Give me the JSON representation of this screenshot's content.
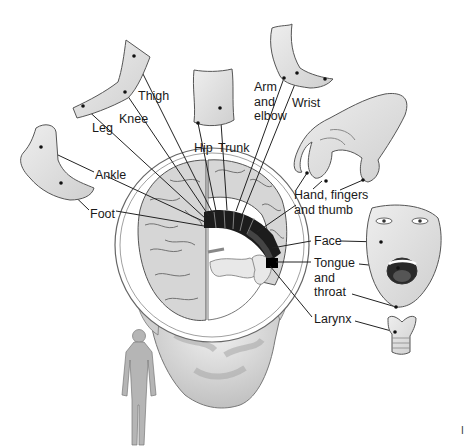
{
  "diagram": {
    "type": "somatotopic-map",
    "colors": {
      "skin_fill": "#e4e4e4",
      "skin_stroke": "#555555",
      "brain_fill": "#d9d9d9",
      "cortex_strip": "#1c1c1c",
      "leader_line": "#222222",
      "text": "#1a1a1a"
    },
    "labels": [
      {
        "id": "thigh",
        "text": "Thigh",
        "x": 138,
        "y": 96
      },
      {
        "id": "knee",
        "text": "Knee",
        "x": 119,
        "y": 111
      },
      {
        "id": "leg",
        "text": "Leg",
        "x": 92,
        "y": 122
      },
      {
        "id": "hip",
        "text": "Hip",
        "x": 194,
        "y": 141
      },
      {
        "id": "trunk",
        "text": "Trunk",
        "x": 218,
        "y": 141
      },
      {
        "id": "arm-elbow",
        "text": "Arm\nand\nelbow",
        "x": 254,
        "y": 82
      },
      {
        "id": "wrist",
        "text": "Wrist",
        "x": 292,
        "y": 96
      },
      {
        "id": "ankle",
        "text": "Ankle",
        "x": 95,
        "y": 169
      },
      {
        "id": "foot",
        "text": "Foot",
        "x": 90,
        "y": 207
      },
      {
        "id": "hand",
        "text": "Hand, fingers\nand thumb",
        "x": 294,
        "y": 190
      },
      {
        "id": "face",
        "text": "Face",
        "x": 314,
        "y": 234
      },
      {
        "id": "tongue",
        "text": "Tongue\nand\nthroat",
        "x": 314,
        "y": 256
      },
      {
        "id": "larynx",
        "text": "Larynx",
        "x": 314,
        "y": 311
      }
    ],
    "corner_fragment": "I"
  }
}
